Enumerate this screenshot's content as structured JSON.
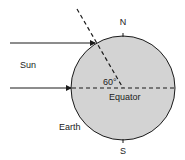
{
  "labels": {
    "north": "N",
    "south": "S",
    "sun": "Sun",
    "earth": "Earth",
    "equator": "Equator",
    "angle": "60°"
  },
  "colors": {
    "earth_fill": "#d3d3d3",
    "stroke": "#1a1a1a",
    "text": "#222222",
    "background": "#ffffff"
  },
  "geometry": {
    "earth_center": [
      123,
      88
    ],
    "earth_radius": 52,
    "sun_ray_upper_y": 43,
    "sun_ray_lower_y": 88,
    "angle_degrees": 60
  }
}
